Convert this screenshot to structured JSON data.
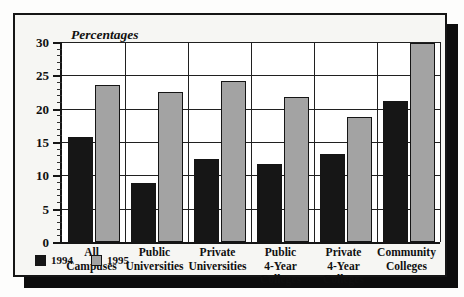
{
  "chart_data": {
    "type": "bar",
    "title": "Percentages",
    "xlabel": "",
    "ylabel": "",
    "ylim": [
      0,
      30
    ],
    "ytick_step": 5,
    "yminor_step": 1,
    "grid": true,
    "legend_position": "bottom-left",
    "categories": [
      "All Campuses",
      "Public Universities",
      "Private Universities",
      "Public 4-Year Colleges",
      "Private 4-Year Colleges",
      "Community Colleges"
    ],
    "category_lines": [
      [
        "All",
        "Campuses"
      ],
      [
        "Public",
        "Universities"
      ],
      [
        "Private",
        "Universities"
      ],
      [
        "Public",
        "4-Year",
        "Colleges"
      ],
      [
        "Private",
        "4-Year",
        "Colleges"
      ],
      [
        "Community",
        "Colleges"
      ]
    ],
    "ytick_labels": [
      "0",
      "5",
      "10",
      "15",
      "20",
      "25",
      "30"
    ],
    "series": [
      {
        "name": "1994",
        "color": "#161616",
        "values": [
          15.8,
          8.8,
          12.4,
          11.7,
          13.2,
          21.1
        ]
      },
      {
        "name": "1995",
        "color": "#a3a3a3",
        "values": [
          23.6,
          22.5,
          24.2,
          21.8,
          18.7,
          29.9
        ]
      }
    ]
  },
  "legend": {
    "items": [
      {
        "label": "1994",
        "color": "#161616"
      },
      {
        "label": "1995",
        "color": "#a3a3a3"
      }
    ]
  },
  "colors": {
    "series_1994": "#161616",
    "series_1995": "#a3a3a3",
    "frame_border": "#151515",
    "gridline": "#202020",
    "plot_background": "#ffffff",
    "figure_background": "#f6f6f3",
    "shadow": "#0d0d0d"
  }
}
